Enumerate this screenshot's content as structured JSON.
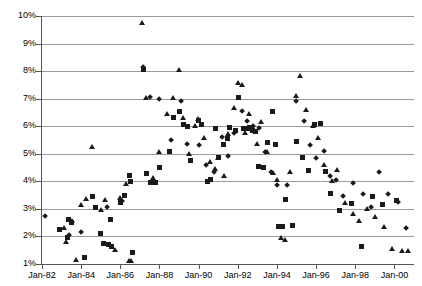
{
  "chart": {
    "title": "",
    "xlabel": "",
    "ylabel": ""
  },
  "axes": {
    "y_ticks": [
      "10%",
      "9%",
      "8%",
      "7%",
      "6%",
      "5%",
      "4%",
      "3%",
      "2%",
      "1%"
    ],
    "x_ticks": [
      "Jan-82",
      "Jan-84",
      "Jan-86",
      "Jan-88",
      "Jan-90",
      "Jan-92",
      "Jan-94",
      "Jan-96",
      "Jan-98",
      "Jan-00"
    ]
  },
  "chart_data": {
    "type": "scatter",
    "title": "",
    "xlabel": "",
    "ylabel": "",
    "grid": true,
    "legend": "none",
    "ylim": [
      1,
      10
    ],
    "ytick_labels": [
      "1%",
      "2%",
      "3%",
      "4%",
      "5%",
      "6%",
      "7%",
      "8%",
      "9%",
      "10%"
    ],
    "xtick_labels": [
      "Jan-82",
      "Jan-84",
      "Jan-86",
      "Jan-88",
      "Jan-90",
      "Jan-92",
      "Jan-94",
      "Jan-96",
      "Jan-98",
      "Jan-00"
    ],
    "xlim": [
      "Jan-82",
      "Jan-01"
    ],
    "marker_types": [
      "square",
      "triangle",
      "diamond"
    ],
    "series": [
      {
        "name": "square",
        "marker": "square",
        "points": [
          [
            1982.9,
            2.25
          ],
          [
            1983.3,
            1.95
          ],
          [
            1983.35,
            2.6
          ],
          [
            1983.5,
            2.5
          ],
          [
            1984.15,
            1.25
          ],
          [
            1984.6,
            3.45
          ],
          [
            1984.75,
            3.05
          ],
          [
            1985.0,
            2.1
          ],
          [
            1985.15,
            1.75
          ],
          [
            1985.4,
            1.7
          ],
          [
            1985.5,
            2.6
          ],
          [
            1985.55,
            1.65
          ],
          [
            1986.0,
            3.25
          ],
          [
            1986.2,
            3.5
          ],
          [
            1986.45,
            4.2
          ],
          [
            1986.5,
            4.0
          ],
          [
            1986.6,
            1.4
          ],
          [
            1987.2,
            8.05
          ],
          [
            1987.35,
            4.3
          ],
          [
            1987.55,
            3.95
          ],
          [
            1987.8,
            3.95
          ],
          [
            1988.0,
            4.5
          ],
          [
            1988.5,
            5.1
          ],
          [
            1988.7,
            6.3
          ],
          [
            1989.0,
            6.55
          ],
          [
            1989.25,
            6.05
          ],
          [
            1989.45,
            6.0
          ],
          [
            1989.6,
            4.75
          ],
          [
            1990.0,
            6.2
          ],
          [
            1990.15,
            6.05
          ],
          [
            1990.45,
            4.0
          ],
          [
            1990.6,
            4.05
          ],
          [
            1990.85,
            5.9
          ],
          [
            1991.0,
            4.85
          ],
          [
            1991.25,
            5.35
          ],
          [
            1991.45,
            5.55
          ],
          [
            1991.6,
            5.95
          ],
          [
            1991.9,
            5.85
          ],
          [
            1992.05,
            7.05
          ],
          [
            1992.3,
            5.9
          ],
          [
            1992.5,
            5.9
          ],
          [
            1992.6,
            5.95
          ],
          [
            1992.75,
            5.85
          ],
          [
            1992.9,
            5.8
          ],
          [
            1993.05,
            4.55
          ],
          [
            1993.3,
            4.5
          ],
          [
            1993.5,
            5.4
          ],
          [
            1993.75,
            6.55
          ],
          [
            1993.95,
            5.35
          ],
          [
            1994.1,
            2.35
          ],
          [
            1994.3,
            2.35
          ],
          [
            1994.45,
            3.35
          ],
          [
            1994.8,
            2.4
          ],
          [
            1995.0,
            5.45
          ],
          [
            1995.3,
            4.85
          ],
          [
            1995.6,
            4.4
          ],
          [
            1995.9,
            6.05
          ],
          [
            1996.2,
            6.1
          ],
          [
            1996.5,
            4.35
          ],
          [
            1996.75,
            3.55
          ],
          [
            1997.2,
            2.95
          ],
          [
            1997.8,
            3.2
          ],
          [
            1998.3,
            1.65
          ],
          [
            1998.9,
            3.45
          ],
          [
            1999.4,
            3.15
          ],
          [
            2000.1,
            3.3
          ]
        ]
      },
      {
        "name": "triangle",
        "marker": "triangle",
        "points": [
          [
            1983.15,
            2.3
          ],
          [
            1983.25,
            1.8
          ],
          [
            1983.55,
            2.55
          ],
          [
            1983.75,
            1.15
          ],
          [
            1984.0,
            3.15
          ],
          [
            1984.25,
            3.35
          ],
          [
            1984.55,
            5.25
          ],
          [
            1985.0,
            2.95
          ],
          [
            1985.25,
            3.3
          ],
          [
            1985.75,
            1.5
          ],
          [
            1986.0,
            3.4
          ],
          [
            1986.3,
            3.9
          ],
          [
            1986.45,
            1.1
          ],
          [
            1986.55,
            1.1
          ],
          [
            1987.1,
            9.75
          ],
          [
            1987.3,
            7.0
          ],
          [
            1987.7,
            4.1
          ],
          [
            1988.0,
            5.05
          ],
          [
            1988.4,
            6.45
          ],
          [
            1988.7,
            7.0
          ],
          [
            1989.0,
            8.05
          ],
          [
            1989.2,
            6.3
          ],
          [
            1989.5,
            5.0
          ],
          [
            1989.8,
            6.0
          ],
          [
            1990.0,
            6.25
          ],
          [
            1990.3,
            5.55
          ],
          [
            1990.6,
            4.7
          ],
          [
            1990.85,
            4.45
          ],
          [
            1991.0,
            4.85
          ],
          [
            1991.3,
            4.2
          ],
          [
            1991.5,
            5.7
          ],
          [
            1991.8,
            6.65
          ],
          [
            1992.0,
            7.55
          ],
          [
            1992.25,
            7.5
          ],
          [
            1992.4,
            5.75
          ],
          [
            1992.6,
            6.45
          ],
          [
            1992.85,
            5.85
          ],
          [
            1993.0,
            5.35
          ],
          [
            1993.2,
            6.15
          ],
          [
            1993.5,
            5.05
          ],
          [
            1993.8,
            4.3
          ],
          [
            1994.0,
            4.05
          ],
          [
            1994.2,
            1.95
          ],
          [
            1994.4,
            1.85
          ],
          [
            1994.7,
            4.35
          ],
          [
            1995.0,
            7.1
          ],
          [
            1995.2,
            7.8
          ],
          [
            1995.5,
            6.6
          ],
          [
            1995.85,
            6.0
          ],
          [
            1996.1,
            5.55
          ],
          [
            1996.4,
            4.6
          ],
          [
            1996.8,
            4.0
          ],
          [
            1997.1,
            4.4
          ],
          [
            1997.5,
            3.2
          ],
          [
            1997.9,
            2.8
          ],
          [
            1998.2,
            2.55
          ],
          [
            1998.6,
            3.0
          ],
          [
            1999.0,
            2.7
          ],
          [
            1999.5,
            2.35
          ],
          [
            1999.9,
            1.55
          ],
          [
            2000.4,
            1.45
          ],
          [
            2000.7,
            1.45
          ]
        ]
      },
      {
        "name": "diamond",
        "marker": "diamond",
        "points": [
          [
            1982.15,
            2.75
          ],
          [
            1983.4,
            2.05
          ],
          [
            1984.0,
            2.15
          ],
          [
            1985.3,
            3.05
          ],
          [
            1986.1,
            3.3
          ],
          [
            1987.15,
            8.15
          ],
          [
            1987.5,
            7.05
          ],
          [
            1988.0,
            7.0
          ],
          [
            1988.6,
            5.5
          ],
          [
            1989.1,
            6.9
          ],
          [
            1989.4,
            5.35
          ],
          [
            1990.0,
            5.3
          ],
          [
            1990.4,
            4.6
          ],
          [
            1990.8,
            4.35
          ],
          [
            1991.2,
            5.6
          ],
          [
            1991.5,
            4.9
          ],
          [
            1991.8,
            5.75
          ],
          [
            1992.2,
            6.55
          ],
          [
            1992.5,
            6.2
          ],
          [
            1992.8,
            6.0
          ],
          [
            1993.1,
            5.95
          ],
          [
            1993.4,
            5.05
          ],
          [
            1993.7,
            4.35
          ],
          [
            1994.0,
            3.85
          ],
          [
            1994.5,
            3.85
          ],
          [
            1995.0,
            6.9
          ],
          [
            1995.4,
            6.2
          ],
          [
            1995.7,
            5.3
          ],
          [
            1996.0,
            4.85
          ],
          [
            1996.4,
            5.1
          ],
          [
            1996.7,
            4.2
          ],
          [
            1997.0,
            4.05
          ],
          [
            1997.4,
            3.45
          ],
          [
            1997.9,
            3.95
          ],
          [
            1998.4,
            3.55
          ],
          [
            1998.8,
            3.05
          ],
          [
            1999.2,
            4.35
          ],
          [
            1999.7,
            3.55
          ],
          [
            2000.2,
            3.25
          ],
          [
            2000.6,
            2.3
          ]
        ]
      }
    ]
  }
}
